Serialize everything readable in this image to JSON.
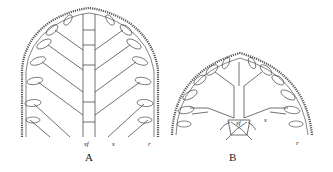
{
  "figure": {
    "panels": [
      {
        "id": "A",
        "label": "A",
        "annotations": {
          "sf": "sf",
          "s": "s",
          "r": "r"
        }
      },
      {
        "id": "B",
        "label": "B",
        "annotations": {
          "sf": "sf",
          "s": "s",
          "r": "r"
        }
      }
    ]
  }
}
